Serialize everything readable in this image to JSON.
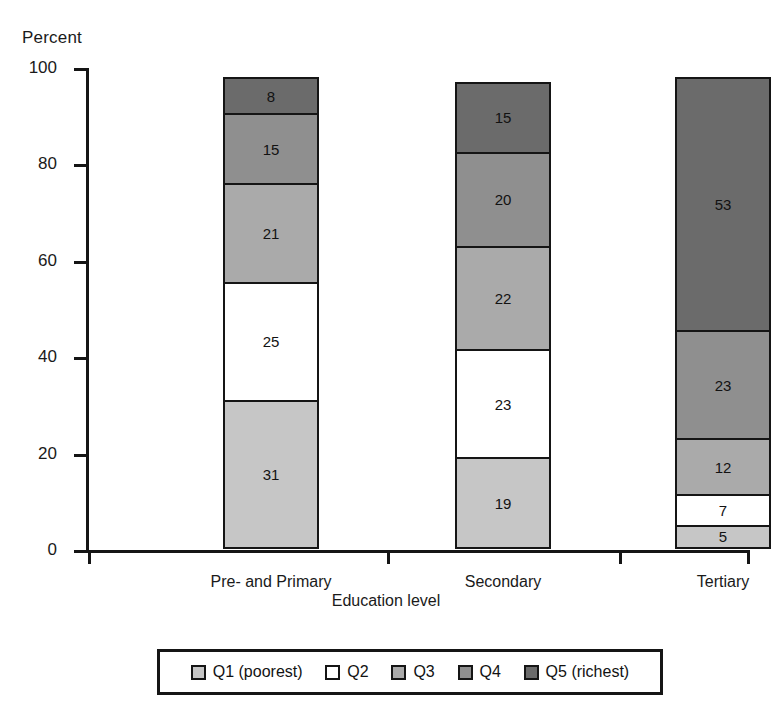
{
  "chart_data": {
    "type": "bar",
    "subtype": "stacked-bar-100",
    "title": "",
    "xlabel": "Education level",
    "ylabel": "Percent",
    "ylim": [
      0,
      100
    ],
    "yticks": [
      0,
      20,
      40,
      60,
      80,
      100
    ],
    "grid": false,
    "legend_position": "bottom",
    "categories": [
      "Pre- and Primary",
      "Secondary",
      "Tertiary"
    ],
    "series": [
      {
        "name": "Q1 (poorest)",
        "color": "#c6c6c6",
        "values": [
          31,
          19,
          5
        ]
      },
      {
        "name": "Q2",
        "color": "#ffffff",
        "values": [
          25,
          23,
          7
        ]
      },
      {
        "name": "Q3",
        "color": "#aaaaaa",
        "values": [
          21,
          22,
          12
        ]
      },
      {
        "name": "Q4",
        "color": "#8f8f8f",
        "values": [
          15,
          20,
          23
        ]
      },
      {
        "name": "Q5 (richest)",
        "color": "#6b6b6b",
        "values": [
          8,
          15,
          53
        ]
      }
    ]
  },
  "axes": {
    "y_title": "Percent",
    "x_title": "Education level",
    "y_tick_labels": [
      "0",
      "20",
      "40",
      "60",
      "80",
      "100"
    ],
    "x_tick_labels": [
      "Pre- and Primary",
      "Secondary",
      "Tertiary"
    ]
  },
  "bars": [
    {
      "category": "Pre- and Primary",
      "segments": [
        {
          "series": "Q5 (richest)",
          "value": 8,
          "label": "8",
          "color": "#6b6b6b"
        },
        {
          "series": "Q4",
          "value": 15,
          "label": "15",
          "color": "#8f8f8f"
        },
        {
          "series": "Q3",
          "value": 21,
          "label": "21",
          "color": "#aaaaaa"
        },
        {
          "series": "Q2",
          "value": 25,
          "label": "25",
          "color": "#ffffff"
        },
        {
          "series": "Q1 (poorest)",
          "value": 31,
          "label": "31",
          "color": "#c6c6c6"
        }
      ]
    },
    {
      "category": "Secondary",
      "segments": [
        {
          "series": "Q5 (richest)",
          "value": 15,
          "label": "15",
          "color": "#6b6b6b"
        },
        {
          "series": "Q4",
          "value": 20,
          "label": "20",
          "color": "#8f8f8f"
        },
        {
          "series": "Q3",
          "value": 22,
          "label": "22",
          "color": "#aaaaaa"
        },
        {
          "series": "Q2",
          "value": 23,
          "label": "23",
          "color": "#ffffff"
        },
        {
          "series": "Q1 (poorest)",
          "value": 19,
          "label": "19",
          "color": "#c6c6c6"
        }
      ]
    },
    {
      "category": "Tertiary",
      "segments": [
        {
          "series": "Q5 (richest)",
          "value": 53,
          "label": "53",
          "color": "#6b6b6b"
        },
        {
          "series": "Q4",
          "value": 23,
          "label": "23",
          "color": "#8f8f8f"
        },
        {
          "series": "Q3",
          "value": 12,
          "label": "12",
          "color": "#aaaaaa"
        },
        {
          "series": "Q2",
          "value": 7,
          "label": "7",
          "color": "#ffffff"
        },
        {
          "series": "Q1 (poorest)",
          "value": 5,
          "label": "5",
          "color": "#c6c6c6"
        }
      ]
    }
  ],
  "legend": {
    "items": [
      {
        "label": "Q1 (poorest)",
        "color": "#c6c6c6"
      },
      {
        "label": "Q2",
        "color": "#ffffff"
      },
      {
        "label": "Q3",
        "color": "#aaaaaa"
      },
      {
        "label": "Q4",
        "color": "#8f8f8f"
      },
      {
        "label": "Q5 (richest)",
        "color": "#6b6b6b"
      }
    ]
  }
}
